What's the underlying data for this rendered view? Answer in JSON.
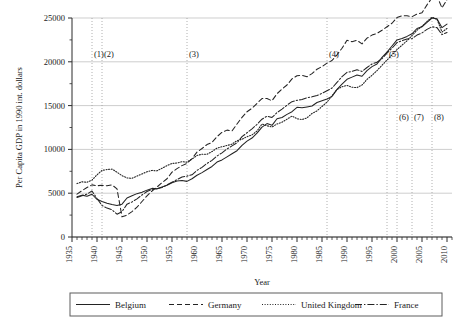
{
  "chart_data": {
    "type": "line",
    "title": "",
    "xlabel": "Year",
    "ylabel": "Per Capita GDP in 1990 int. dollars",
    "xlim": [
      1935,
      2011
    ],
    "ylim": [
      0,
      25000
    ],
    "grid": "horizontal gridlines at y ticks plus vertical dotted event lines",
    "legend_position": "below plot, single row, boxed",
    "y_ticks": [
      0,
      5000,
      10000,
      15000,
      20000,
      25000
    ],
    "y_tick_labels": [
      "0",
      "5000",
      "10000",
      "15000",
      "20000",
      "25000"
    ],
    "x_ticks": [
      1935,
      1940,
      1945,
      1950,
      1955,
      1960,
      1965,
      1970,
      1975,
      1980,
      1985,
      1990,
      1995,
      2000,
      2005,
      2010
    ],
    "x_tick_labels": [
      "1935",
      "1940",
      "1945",
      "1950",
      "1955",
      "1960",
      "1965",
      "1970",
      "1975",
      "1980",
      "1985",
      "1990",
      "1995",
      "2000",
      "2005",
      "2010"
    ],
    "x_minor_tick_step": 1,
    "event_lines": [
      {
        "label": "(1)",
        "x": 1939,
        "label_y": 20600
      },
      {
        "label": "(2)",
        "x": 1941,
        "label_y": 20600
      },
      {
        "label": "(3)",
        "x": 1958,
        "label_y": 20600
      },
      {
        "label": "(4)",
        "x": 1986,
        "label_y": 20600
      },
      {
        "label": "(5)",
        "x": 1998,
        "label_y": 20600
      },
      {
        "label": "(6)",
        "x": 2000,
        "label_y": 13300
      },
      {
        "label": "(7)",
        "x": 2003,
        "label_y": 13300
      },
      {
        "label": "(8)",
        "x": 2007,
        "label_y": 13300
      }
    ],
    "series": [
      {
        "name": "Belgium",
        "style": "solid",
        "x": [
          1936,
          1937,
          1938,
          1939,
          1940,
          1941,
          1942,
          1943,
          1944,
          1945,
          1946,
          1947,
          1948,
          1949,
          1950,
          1951,
          1952,
          1953,
          1954,
          1955,
          1956,
          1957,
          1958,
          1959,
          1960,
          1961,
          1962,
          1963,
          1964,
          1965,
          1966,
          1967,
          1968,
          1969,
          1970,
          1971,
          1972,
          1973,
          1974,
          1975,
          1976,
          1977,
          1978,
          1979,
          1980,
          1981,
          1982,
          1983,
          1984,
          1985,
          1986,
          1987,
          1988,
          1989,
          1990,
          1991,
          1992,
          1993,
          1994,
          1995,
          1996,
          1997,
          1998,
          1999,
          2000,
          2001,
          2002,
          2003,
          2004,
          2005,
          2006,
          2007,
          2008,
          2009,
          2010
        ],
        "values": [
          4600,
          4780,
          4650,
          4880,
          4300,
          4050,
          3850,
          3700,
          3600,
          3750,
          4450,
          4700,
          4950,
          5100,
          5350,
          5550,
          5500,
          5700,
          5900,
          6200,
          6400,
          6450,
          6350,
          6650,
          7050,
          7350,
          7700,
          8050,
          8550,
          8800,
          9150,
          9500,
          9850,
          10450,
          10950,
          11300,
          11850,
          12550,
          12950,
          12750,
          13500,
          13650,
          14000,
          14300,
          14800,
          14750,
          14850,
          14950,
          15350,
          15550,
          15750,
          16050,
          16850,
          17450,
          18000,
          18250,
          18500,
          18350,
          19000,
          19450,
          19750,
          20500,
          21100,
          21800,
          22500,
          22650,
          22900,
          23200,
          23800,
          24000,
          24500,
          25000,
          24900,
          23900,
          24300
        ]
      },
      {
        "name": "Germany",
        "style": "dashed",
        "x": [
          1936,
          1937,
          1938,
          1939,
          1940,
          1941,
          1942,
          1943,
          1944,
          1945,
          1946,
          1947,
          1948,
          1949,
          1950,
          1951,
          1952,
          1953,
          1954,
          1955,
          1956,
          1957,
          1958,
          1959,
          1960,
          1961,
          1962,
          1963,
          1964,
          1965,
          1966,
          1967,
          1968,
          1969,
          1970,
          1971,
          1972,
          1973,
          1974,
          1975,
          1976,
          1977,
          1978,
          1979,
          1980,
          1981,
          1982,
          1983,
          1984,
          1985,
          1986,
          1987,
          1988,
          1989,
          1990,
          1991,
          1992,
          1993,
          1994,
          1995,
          1996,
          1997,
          1998,
          1999,
          2000,
          2001,
          2002,
          2003,
          2004,
          2005,
          2006,
          2007,
          2008,
          2009,
          2010
        ],
        "values": [
          4900,
          5300,
          5650,
          5950,
          5850,
          5900,
          5850,
          5950,
          5500,
          2300,
          2500,
          2900,
          3400,
          4050,
          4700,
          5250,
          5700,
          6200,
          6650,
          7400,
          7800,
          8150,
          8400,
          8950,
          9700,
          10100,
          10550,
          10800,
          11450,
          11950,
          12200,
          12100,
          12900,
          13650,
          14300,
          14700,
          15250,
          15800,
          15800,
          15550,
          16350,
          16900,
          17350,
          18050,
          18400,
          18450,
          18300,
          18650,
          19150,
          19450,
          19850,
          20150,
          20800,
          21550,
          22450,
          22300,
          22450,
          22050,
          22700,
          23050,
          23250,
          23600,
          24000,
          24400,
          25050,
          25250,
          25250,
          25150,
          25450,
          25600,
          26500,
          27300,
          27500,
          26150,
          27100
        ]
      },
      {
        "name": "United Kingdom",
        "style": "dotted",
        "x": [
          1936,
          1937,
          1938,
          1939,
          1940,
          1941,
          1942,
          1943,
          1944,
          1945,
          1946,
          1947,
          1948,
          1949,
          1950,
          1951,
          1952,
          1953,
          1954,
          1955,
          1956,
          1957,
          1958,
          1959,
          1960,
          1961,
          1962,
          1963,
          1964,
          1965,
          1966,
          1967,
          1968,
          1969,
          1970,
          1971,
          1972,
          1973,
          1974,
          1975,
          1976,
          1977,
          1978,
          1979,
          1980,
          1981,
          1982,
          1983,
          1984,
          1985,
          1986,
          1987,
          1988,
          1989,
          1990,
          1991,
          1992,
          1993,
          1994,
          1995,
          1996,
          1997,
          1998,
          1999,
          2000,
          2001,
          2002,
          2003,
          2004,
          2005,
          2006,
          2007,
          2008,
          2009,
          2010
        ],
        "values": [
          6100,
          6300,
          6250,
          6500,
          7100,
          7600,
          7700,
          7750,
          7400,
          7000,
          6750,
          6700,
          6950,
          7200,
          7450,
          7600,
          7550,
          7850,
          8150,
          8400,
          8450,
          8600,
          8550,
          8900,
          9300,
          9450,
          9450,
          9750,
          10150,
          10300,
          10450,
          10600,
          11000,
          11150,
          11450,
          11650,
          12100,
          12900,
          12700,
          12550,
          12900,
          13100,
          13450,
          13800,
          13500,
          13400,
          13600,
          14100,
          14400,
          14900,
          15400,
          16100,
          16850,
          17150,
          17300,
          17100,
          17050,
          17350,
          18000,
          18450,
          19000,
          19600,
          20200,
          20800,
          21400,
          21900,
          22400,
          23000,
          23600,
          24050,
          24600,
          25100,
          24850,
          23400,
          23800
        ]
      },
      {
        "name": "France",
        "style": "dashdot",
        "x": [
          1936,
          1937,
          1938,
          1939,
          1940,
          1941,
          1942,
          1943,
          1944,
          1945,
          1946,
          1947,
          1948,
          1949,
          1950,
          1951,
          1952,
          1953,
          1954,
          1955,
          1956,
          1957,
          1958,
          1959,
          1960,
          1961,
          1962,
          1963,
          1964,
          1965,
          1966,
          1967,
          1968,
          1969,
          1970,
          1971,
          1972,
          1973,
          1974,
          1975,
          1976,
          1977,
          1978,
          1979,
          1980,
          1981,
          1982,
          1983,
          1984,
          1985,
          1986,
          1987,
          1988,
          1989,
          1990,
          1991,
          1992,
          1993,
          1994,
          1995,
          1996,
          1997,
          1998,
          1999,
          2000,
          2001,
          2002,
          2003,
          2004,
          2005,
          2006,
          2007,
          2008,
          2009,
          2010
        ],
        "values": [
          4500,
          4700,
          4900,
          5250,
          4400,
          3600,
          3300,
          3100,
          2600,
          2900,
          3750,
          4000,
          4350,
          4800,
          5200,
          5450,
          5500,
          5650,
          5950,
          6250,
          6550,
          6850,
          6950,
          7100,
          7600,
          7950,
          8400,
          8750,
          9250,
          9600,
          10050,
          10400,
          10750,
          11450,
          11900,
          12350,
          12850,
          13450,
          13800,
          13650,
          14200,
          14600,
          15050,
          15450,
          15600,
          15700,
          15900,
          16000,
          16150,
          16400,
          16700,
          17000,
          17650,
          18300,
          18800,
          18900,
          19100,
          18900,
          19350,
          19750,
          19950,
          20350,
          21000,
          21550,
          22200,
          22400,
          22600,
          22650,
          23050,
          23300,
          23700,
          24000,
          23900,
          23100,
          23350
        ]
      }
    ]
  },
  "legend": {
    "entries": [
      {
        "label": "Belgium",
        "style": "solid"
      },
      {
        "label": "Germany",
        "style": "dashed"
      },
      {
        "label": "United Kingdom",
        "style": "dotted"
      },
      {
        "label": "France",
        "style": "dashdot"
      }
    ]
  }
}
